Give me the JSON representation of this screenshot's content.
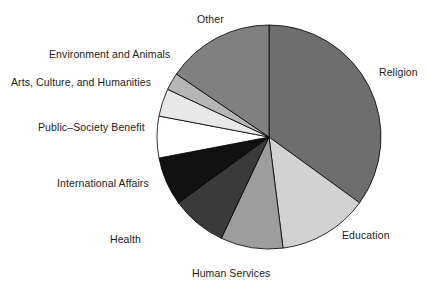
{
  "chart_data": {
    "type": "pie",
    "title": "",
    "subtitle": "",
    "xlabel": "",
    "ylabel": "",
    "legend_position": "none",
    "grid": false,
    "labels_outside": true,
    "start_angle_deg": 90,
    "direction": "clockwise",
    "categories": [
      "Religion",
      "Education",
      "Human Services",
      "Health",
      "International Affairs",
      "Public–Society Benefit",
      "Arts, Culture, and Humanities",
      "Environment and Animals",
      "Other"
    ],
    "values": [
      35.0,
      13.0,
      9.0,
      8.0,
      7.0,
      6.0,
      4.0,
      2.5,
      15.5
    ],
    "units": "percent",
    "slice_colors": [
      "#6e6e6e",
      "#d2d2d2",
      "#9d9d9d",
      "#3a3a3a",
      "#111111",
      "#ffffff",
      "#e8e8e8",
      "#b6b6b6",
      "#808080"
    ],
    "slices": [
      {
        "label": "Religion",
        "value": 35.0,
        "color": "#6e6e6e"
      },
      {
        "label": "Education",
        "value": 13.0,
        "color": "#d2d2d2"
      },
      {
        "label": "Human Services",
        "value": 9.0,
        "color": "#9d9d9d"
      },
      {
        "label": "Health",
        "value": 8.0,
        "color": "#3a3a3a"
      },
      {
        "label": "International Affairs",
        "value": 7.0,
        "color": "#111111"
      },
      {
        "label": "Public–Society Benefit",
        "value": 6.0,
        "color": "#ffffff"
      },
      {
        "label": "Arts, Culture, and Humanities",
        "value": 4.0,
        "color": "#e8e8e8"
      },
      {
        "label": "Environment and Animals",
        "value": 2.5,
        "color": "#b6b6b6"
      },
      {
        "label": "Other",
        "value": 15.5,
        "color": "#808080"
      }
    ]
  },
  "geometry": {
    "center_x": 269,
    "center_y": 137,
    "radius": 112
  },
  "labels": {
    "religion": "Religion",
    "education": "Education",
    "human_services": "Human Services",
    "health": "Health",
    "international_affairs": "International Affairs",
    "public_society_benefit": "Public–Society Benefit",
    "arts_culture_humanities": "Arts, Culture, and Humanities",
    "environment_animals": "Environment and Animals",
    "other": "Other"
  },
  "style": {
    "background": "#ffffff",
    "outline": "#000000",
    "text_color": "#1c1c1c"
  }
}
